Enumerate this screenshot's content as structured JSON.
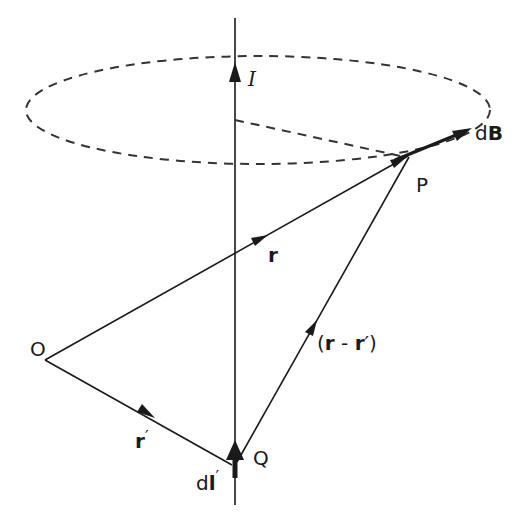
{
  "diagram": {
    "colors": {
      "ink": "#1a1a1a",
      "background": "#ffffff"
    },
    "labels": {
      "current": "I",
      "field_element": "dB",
      "field_d": "d",
      "field_B": "B",
      "point_P": "P",
      "origin_O": "O",
      "point_Q": "Q",
      "vector_r": "r",
      "vector_r_prime": "r",
      "prime": "′",
      "vector_diff": "(r - r′)",
      "diff_open": "(",
      "diff_r": "r",
      "diff_minus": " - ",
      "diff_close": ")",
      "line_element_d": "d",
      "line_element_l": "l"
    },
    "nodes": {
      "O": {
        "x": 45,
        "y": 360
      },
      "Q": {
        "x": 235,
        "y": 467
      },
      "P": {
        "x": 410,
        "y": 155
      }
    },
    "vectors": [
      {
        "name": "r",
        "from": "O",
        "to": "P"
      },
      {
        "name": "r′",
        "from": "O",
        "to": "Q"
      },
      {
        "name": "(r - r′)",
        "from": "Q",
        "to": "P"
      },
      {
        "name": "dl′",
        "at": "Q",
        "direction": "up"
      },
      {
        "name": "dB",
        "at": "P",
        "direction": "tangent"
      }
    ],
    "circle": {
      "style": "dashed",
      "center_on_axis": true,
      "through": "P"
    }
  }
}
